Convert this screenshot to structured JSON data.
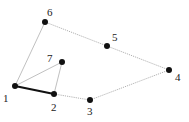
{
  "diagram": {
    "type": "graph",
    "nodes": [
      {
        "id": "1",
        "label": "1",
        "x": 15,
        "y": 86,
        "lx": 3,
        "ly": 102
      },
      {
        "id": "2",
        "label": "2",
        "x": 54,
        "y": 94,
        "lx": 51,
        "ly": 111
      },
      {
        "id": "3",
        "label": "3",
        "x": 90,
        "y": 100,
        "lx": 87,
        "ly": 115
      },
      {
        "id": "4",
        "label": "4",
        "x": 169,
        "y": 70,
        "lx": 175,
        "ly": 81
      },
      {
        "id": "5",
        "label": "5",
        "x": 107,
        "y": 46,
        "lx": 112,
        "ly": 41
      },
      {
        "id": "6",
        "label": "6",
        "x": 45,
        "y": 22,
        "lx": 47,
        "ly": 16
      },
      {
        "id": "7",
        "label": "7",
        "x": 62,
        "y": 62,
        "lx": 47,
        "ly": 62
      }
    ],
    "edges": [
      {
        "from": "1",
        "to": "6",
        "style": "thin"
      },
      {
        "from": "1",
        "to": "7",
        "style": "thin"
      },
      {
        "from": "7",
        "to": "2",
        "style": "thin"
      },
      {
        "from": "1",
        "to": "2",
        "style": "thick"
      },
      {
        "from": "2",
        "to": "3",
        "style": "dotted"
      },
      {
        "from": "3",
        "to": "4",
        "style": "dotted"
      },
      {
        "from": "4",
        "to": "5",
        "style": "dotted"
      },
      {
        "from": "5",
        "to": "6",
        "style": "dotted"
      }
    ],
    "colors": {
      "node": "#111111",
      "thin_edge": "#b0b0b0",
      "thick_edge": "#111111",
      "dotted_edge": "#a8a8a8",
      "label": "#222222"
    }
  }
}
